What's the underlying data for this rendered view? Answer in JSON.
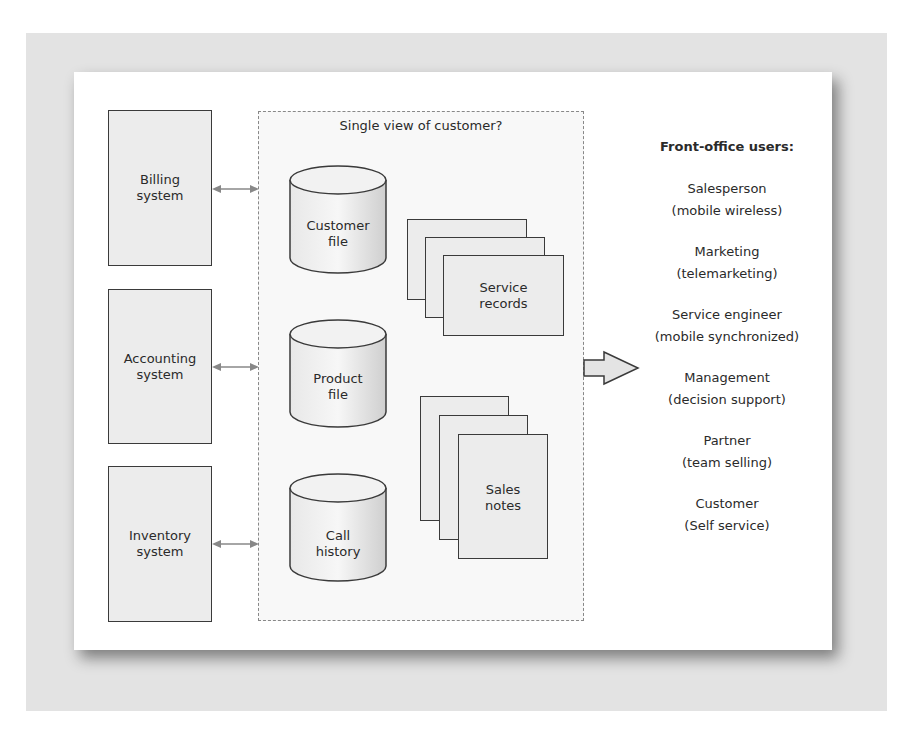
{
  "diagram": {
    "back_office_systems": [
      {
        "label_line1": "Billing",
        "label_line2": "system"
      },
      {
        "label_line1": "Accounting",
        "label_line2": "system"
      },
      {
        "label_line1": "Inventory",
        "label_line2": "system"
      }
    ],
    "central_box": {
      "title": "Single view of customer?",
      "databases": [
        {
          "line1": "Customer",
          "line2": "file"
        },
        {
          "line1": "Product",
          "line2": "file"
        },
        {
          "line1": "Call",
          "line2": "history"
        }
      ],
      "document_stacks": [
        {
          "line1": "Service",
          "line2": "records"
        },
        {
          "line1": "Sales",
          "line2": "notes"
        }
      ]
    },
    "front_office": {
      "header": "Front-office users:",
      "users": [
        {
          "role": "Salesperson",
          "channel": "(mobile wireless)"
        },
        {
          "role": "Marketing",
          "channel": "(telemarketing)"
        },
        {
          "role": "Service engineer",
          "channel": "(mobile synchronized)"
        },
        {
          "role": "Management",
          "channel": "(decision support)"
        },
        {
          "role": "Partner",
          "channel": "(team selling)"
        },
        {
          "role": "Customer",
          "channel": "(Self service)"
        }
      ]
    }
  }
}
